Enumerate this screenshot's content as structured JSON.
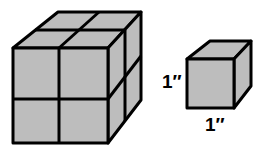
{
  "diagram": {
    "large_cube": {
      "description": "2x2x2 cube made of unit cubes"
    },
    "small_cube": {
      "description": "unit cube"
    },
    "labels": {
      "height": "1″",
      "width": "1″"
    },
    "colors": {
      "face": "#bdbdbd",
      "edge": "#000000"
    }
  }
}
